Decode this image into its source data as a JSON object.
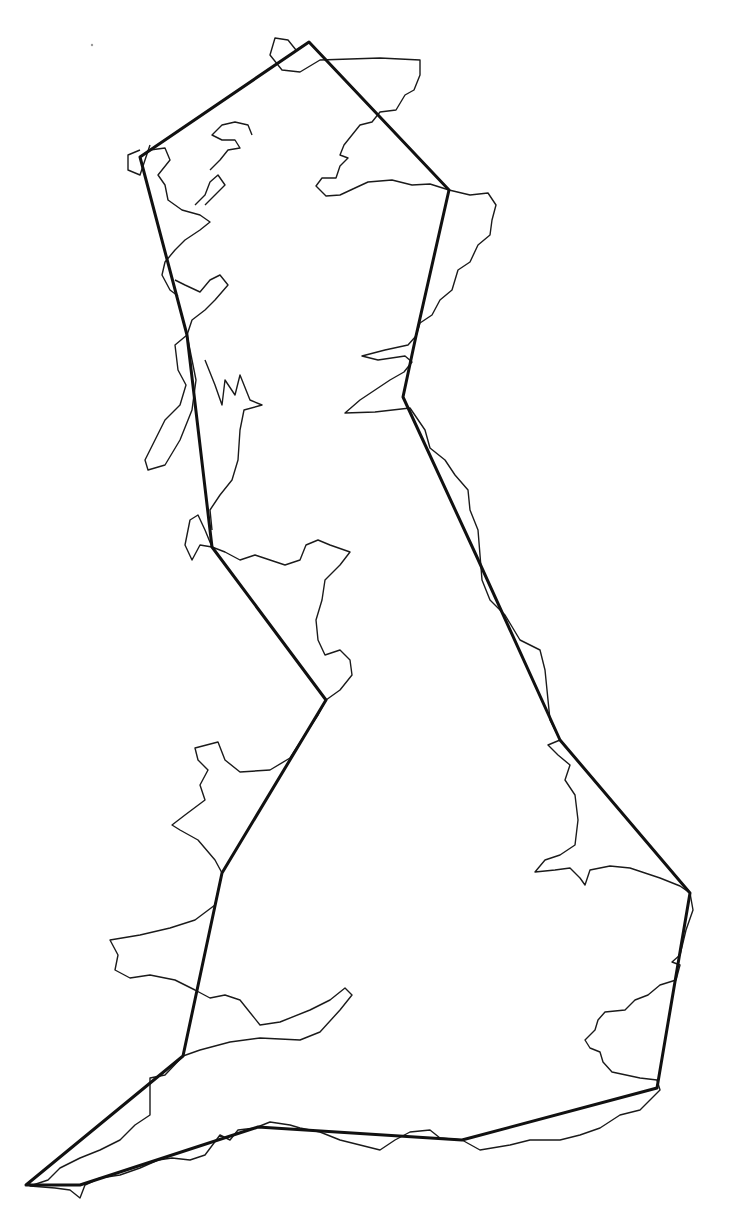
{
  "map": {
    "subject": "Great Britain coastline with simplified polygon outline",
    "background": "#ffffff",
    "coast_color": "#1a1a1a",
    "polygon_color": "#111111",
    "polygon_vertices": [
      [
        309,
        42
      ],
      [
        449,
        190
      ],
      [
        416,
        336
      ],
      [
        403,
        397
      ],
      [
        476,
        555
      ],
      [
        560,
        740
      ],
      [
        690,
        893
      ],
      [
        657,
        1088
      ],
      [
        462,
        1140
      ],
      [
        258,
        1127
      ],
      [
        80,
        1185
      ],
      [
        26,
        1185
      ],
      [
        183,
        1056
      ],
      [
        222,
        873
      ],
      [
        326,
        700
      ],
      [
        212,
        547
      ],
      [
        187,
        335
      ],
      [
        140,
        157
      ]
    ],
    "coast_paths": [
      "M309,42 L296,50 L288,40 L275,38 L270,55 L282,70 L300,72 L320,60 L380,58 L420,60 L420,75 L414,90 L405,95 L396,110 L380,112 L372,122 L360,125 L352,135 L344,145 L340,155 L348,158 L340,166 L336,178 L322,178 L316,186 L326,196 L340,195 L355,188 L368,182 L392,180 L412,185 L430,184 L449,190 L470,195 L488,193 L496,205 L492,220 L490,235 L478,245 L470,262 L458,270 L452,290 L440,300 L432,315 L420,323 L416,336 L408,345 L385,350 L362,356 L378,360 L405,356 L412,362 L404,372 L390,380 L375,390 L360,400 L345,413 L375,412 L410,408 L425,430 L430,448 L445,460 L455,475 L468,490 L470,510 L478,530 L480,555 L482,580 L490,600 L505,615 L520,640 L540,650 L545,670 L548,700 L550,720 L560,740 L548,745 L558,755 L570,765 L565,780 L575,795 L578,820 L575,845 L560,855 L545,860 L535,872 L555,870 L570,868 L580,878 L585,885 L590,870 L610,866 L630,868 L660,878 L680,886 L690,893 L693,910 L686,930 L680,955 L672,962 L680,965 L676,980 L660,985 L648,995 L635,1000 L625,1010 L605,1012 L598,1020 L595,1030 L585,1040 L590,1048 L600,1052 L603,1062 L612,1072 L640,1078 L657,1080 L660,1090 L650,1100 L640,1110 L620,1115 L600,1128 L580,1135 L560,1140 L530,1140 L510,1145 L480,1150 L462,1140 L440,1138 L430,1130 L410,1132 L395,1140 L380,1150 L360,1145 L340,1140 L320,1132 L300,1128 L290,1125 L270,1122 L255,1128 L238,1130 L230,1140 L220,1135 L205,1155 L190,1160 L172,1158 L158,1160 L140,1168 L120,1175 L100,1178 L85,1185 L80,1198 L70,1190 L55,1188 L30,1186 L48,1180 L60,1168 L80,1158 L100,1150 L120,1140 L135,1125 L150,1115 L150,1078 L165,1075 L183,1056 L200,1050 L230,1042 L260,1038 L300,1040 L320,1032 L340,1010 L352,995 L345,988 L330,1000 L310,1010 L280,1022 L260,1025 L248,1010 L240,1000 L225,995 L210,998 L195,990 L175,980 L150,975 L130,978 L115,970 L118,955 L110,940 L140,935 L170,928 L195,920 L215,905 L222,873 L215,860 L198,840 L180,830 L172,825 L185,815 L205,800 L200,785 L208,770 L198,760 L195,748 L218,742 L225,760 L240,772 L270,770 L290,758 L308,730 L318,715 L326,700 L340,690 L352,675 L350,660 L340,650 L325,655 L318,640 L316,620 L322,600 L325,580 L340,565 L350,552 L330,545 L318,540 L306,545 L300,560 L285,565 L270,560 L255,555 L240,560 L225,552 L212,547 L205,530 L198,515 L190,520 L185,545 L192,560 L200,545 L212,547",
      "M187,335 L175,345 L178,370 L186,385 L180,405 L165,420 L155,440 L145,460 L148,470 L165,465 L180,440 L192,410 L196,380 L187,335",
      "M205,360 L215,385 L222,405 L225,380 L235,395 L240,375 L250,400 L262,405 L244,410 L240,430 L238,460 L232,480 L220,495 L210,510 L212,530",
      "M175,280 L185,285 L200,292 L210,280 L220,275 L228,285 L215,300 L205,310 L192,320 L187,335",
      "M140,157 L150,150 L165,148 L170,160 L158,175 L165,185 L168,200 L182,210 L200,215 L210,222 L200,230 L185,240 L175,250 L165,262 L162,275 L170,290 L178,296",
      "M195,205 L205,195 L210,182 L218,175 L225,185 L215,195 L205,205 M210,170 L220,160 L228,150 L240,148 L235,140 L222,140 L212,135 L222,125 L235,122 L248,125 L252,135",
      "M150,145 L145,160 L140,175 L128,170 L128,155 L140,150"
    ],
    "marker_dot": [
      92,
      45
    ]
  }
}
